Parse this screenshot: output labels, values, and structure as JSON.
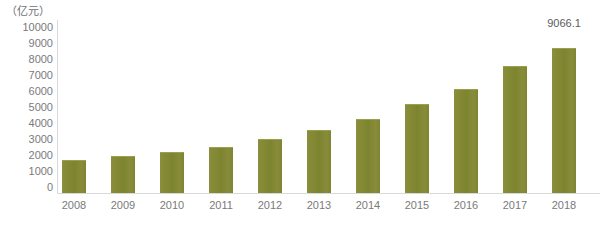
{
  "chart_data": {
    "type": "bar",
    "title": "",
    "subtitle": "",
    "unit_label": "（亿元）",
    "xlabel": "",
    "ylabel": "",
    "categories": [
      "2008",
      "2009",
      "2010",
      "2011",
      "2012",
      "2013",
      "2014",
      "2015",
      "2016",
      "2017",
      "2018"
    ],
    "values": [
      2060,
      2300,
      2570,
      2880,
      3380,
      3940,
      4630,
      5560,
      6500,
      7940,
      9066.1
    ],
    "series": [
      {
        "name": "",
        "values": [
          2060,
          2300,
          2570,
          2880,
          3380,
          3940,
          4630,
          5560,
          6500,
          7940,
          9066.1
        ]
      }
    ],
    "data_labels": [
      "",
      "",
      "",
      "",
      "",
      "",
      "",
      "",
      "",
      "",
      "9066.1"
    ],
    "ylim": [
      0,
      10000
    ],
    "ytick_values": [
      10000,
      9000,
      8000,
      7000,
      6000,
      5000,
      4000,
      3000,
      2000,
      1000,
      0
    ],
    "ytick_labels": [
      "10000",
      "9000",
      "8000",
      "7000",
      "6000",
      "5000",
      "4000",
      "3000",
      "2000",
      "1000",
      "0"
    ],
    "grid": false,
    "legend": null,
    "legend_position": "none",
    "bar_color": "#828732",
    "axis_color": "#d9d9d9",
    "tick_text_color": "#7a7a7a",
    "label_text_color": "#5b5b5b",
    "background_color": "#ffffff"
  },
  "ytick_positions_px": [
    27,
    43,
    59,
    75,
    91,
    107,
    123,
    139,
    155,
    171,
    187
  ],
  "bars": [
    {
      "label": "2008",
      "value": 2060,
      "left": 62,
      "width": 24,
      "height": 33,
      "center": 74
    },
    {
      "label": "2009",
      "value": 2300,
      "left": 111,
      "width": 24,
      "height": 37,
      "center": 123
    },
    {
      "label": "2010",
      "value": 2570,
      "left": 160,
      "width": 24,
      "height": 41,
      "center": 172
    },
    {
      "label": "2011",
      "value": 2880,
      "left": 209,
      "width": 24,
      "height": 46,
      "center": 221
    },
    {
      "label": "2012",
      "value": 3380,
      "left": 258,
      "width": 24,
      "height": 54,
      "center": 270
    },
    {
      "label": "2013",
      "value": 3940,
      "left": 307,
      "width": 24,
      "height": 63,
      "center": 319
    },
    {
      "label": "2014",
      "value": 4630,
      "left": 356,
      "width": 24,
      "height": 74,
      "center": 368
    },
    {
      "label": "2015",
      "value": 5560,
      "left": 405,
      "width": 24,
      "height": 89,
      "center": 417
    },
    {
      "label": "2016",
      "value": 6500,
      "left": 454,
      "width": 24,
      "height": 104,
      "center": 466
    },
    {
      "label": "2017",
      "value": 7940,
      "left": 503,
      "width": 24,
      "height": 127,
      "center": 515
    },
    {
      "label": "2018",
      "value": 9066.1,
      "left": 552,
      "width": 24,
      "height": 145,
      "center": 564
    }
  ],
  "value_label": {
    "text": "9066.1",
    "bar_index": 10,
    "x": 564,
    "y": 17
  }
}
